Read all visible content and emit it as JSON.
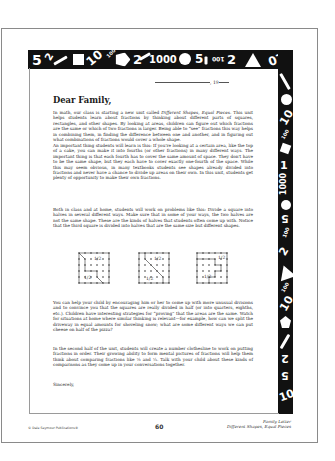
{
  "document": {
    "date_line": {
      "prefix": "",
      "year_prefix": ", 19"
    },
    "greeting": "Dear Family,",
    "paragraphs": {
      "p1_a": "In math, our class is starting a new unit called ",
      "p1_title": "Different Shapes, Equal Pieces.",
      "p1_b": " This unit helps students learn about fractions by thinking about different parts of squares, rectangles, and other shapes. By looking at areas, children can figure out which fractions are the same or which of two fractions is larger. Being able to “see” fractions this way helps in combining them, in finding the difference between one and another, and in figuring out what combinations of fractions would cover a whole shape.",
      "p1_c": "An important thing students will learn is this: If you're looking at a certain area, like the top of a cake, you can make it into fourths (or other fractions) in many different ways. The important thing is that each fourth has to cover the same amount of space. They don't have to be the same shape, but they each have to cover exactly one-fourth of the space. While this may seem obvious, in many textbooks students see shapes already divided into fractions and never have a chance to divide up areas on their own. In this unit, students get plenty of opportunity to make their own fractions.",
      "p2": "Both in class and at home, students will work on problems like this: Divide a square into halves in several different ways. Make sure that in some of your ways, the two halves are not the same shape. These are the kinds of halves that students often come up with. Notice that the third square is divided into halves that are the same size but different shapes.",
      "p3": "You can help your child by encouraging him or her to come up with more unusual divisions and to convince you that the squares are really divided in half (or into quarters, eighths, etc.). Children have interesting strategies for “proving” that the areas are the same. Watch for situations at home where similar thinking is relevant—for example, how can we split the driveway in equal amounts for shoveling snow; what are some different ways we can put cheese on half of the pizza?",
      "p4": "In the second half of the unit, students will create a number clothesline to work on putting fractions in order. Their growing ability to form mental pictures of fractions will help them think about comparing fractions like ⅓ and ¼. Talk with your child about these kinds of comparisons as they come up in your conversations together."
    },
    "figures": [
      {
        "label_a": "1/2",
        "label_b": "1/2"
      },
      {
        "label_a": "1/2",
        "label_b": "1/2"
      },
      {
        "label_a": "1/2",
        "label_b": "1/2"
      }
    ],
    "closing": "Sincerely,"
  },
  "border_strip": {
    "top_glyphs": [
      "5",
      "2",
      "10",
      "100",
      "2",
      "1000",
      "5",
      "100",
      "2",
      "10",
      "2"
    ],
    "right_glyphs": [
      "10",
      "100",
      "1",
      "1000",
      "5",
      "100",
      "2",
      "100",
      "10",
      "2",
      "5",
      "10"
    ],
    "icons": [
      "pencil-icon",
      "square-icon",
      "pentagon-icon",
      "circle-icon",
      "triangle-icon"
    ]
  },
  "footer": {
    "copyright": "© Dale Seymour Publications®",
    "page_number": "60",
    "title_line1": "Family Letter",
    "title_line2": "Different Shapes, Equal Pieces"
  }
}
